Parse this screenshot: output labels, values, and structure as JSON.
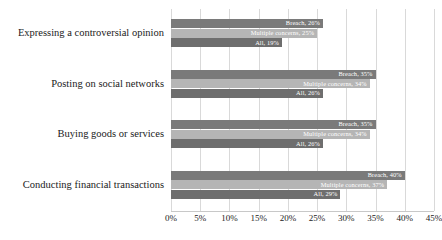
{
  "chart_data": {
    "type": "bar",
    "orientation": "horizontal",
    "title": "",
    "subtitle": "",
    "xlabel": "",
    "ylabel": "",
    "xlim": [
      0,
      45
    ],
    "grid": true,
    "legend_position": "none",
    "note": "Data labels are drawn inside each bar, right-aligned, as 'Series, value%'",
    "xticks": [
      "0%",
      "5%",
      "10%",
      "15%",
      "20%",
      "25%",
      "30%",
      "35%",
      "40%",
      "45%"
    ],
    "xtick_values": [
      0,
      5,
      10,
      15,
      20,
      25,
      30,
      35,
      40,
      45
    ],
    "categories": [
      "Expressing a controversial opinion",
      "Posting on social networks",
      "Buying goods or services",
      "Conducting financial transactions"
    ],
    "series": [
      {
        "name": "Breach",
        "color": "#7a7a7a",
        "values": [
          26,
          35,
          35,
          40
        ],
        "labels": [
          "Breach, 26%",
          "Breach, 35%",
          "Breach, 35%",
          "Breach, 40%"
        ]
      },
      {
        "name": "Multiple concerns",
        "color": "#b5b5b5",
        "values": [
          25,
          34,
          34,
          37
        ],
        "labels": [
          "Multiple concerns, 25%",
          "Multiple concerns, 34%",
          "Multiple concerns, 34%",
          "Multiple concerns, 37%"
        ]
      },
      {
        "name": "All",
        "color": "#6e6e6e",
        "values": [
          19,
          26,
          26,
          29
        ],
        "labels": [
          "All, 19%",
          "All, 26%",
          "All, 26%",
          "All, 29%"
        ]
      }
    ]
  }
}
